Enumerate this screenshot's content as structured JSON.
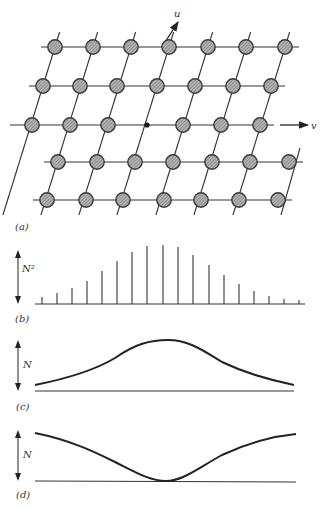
{
  "figure": {
    "panels": [
      {
        "id": "a",
        "label": "(a)",
        "description": "Oblique 2D lattice of hatched atoms with u and v axes; origin marked by a small black dot"
      },
      {
        "id": "b",
        "label": "(b)",
        "axis_label": "N²",
        "description": "Discrete stick spectrum, intensity N² vs position"
      },
      {
        "id": "c",
        "label": "(c)",
        "axis_label": "N",
        "description": "Smooth peaked envelope"
      },
      {
        "id": "d",
        "label": "(d)",
        "axis_label": "N",
        "description": "Smooth inverted (dip) envelope touching baseline at center"
      }
    ],
    "axes": {
      "u_label": "u",
      "v_label": "v"
    },
    "lattice": {
      "rows": [
        {
          "y": 47,
          "x": [
            55,
            93,
            131,
            169,
            208,
            246,
            285
          ]
        },
        {
          "y": 86,
          "x": [
            43,
            80,
            117,
            157,
            195,
            233,
            271
          ]
        },
        {
          "y": 125,
          "x": [
            32,
            70,
            108,
            183,
            221,
            260
          ]
        },
        {
          "y": 162,
          "x": [
            58,
            97,
            135,
            173,
            212,
            250,
            289
          ]
        },
        {
          "y": 200,
          "x": [
            47,
            86,
            123,
            164,
            201,
            239,
            278
          ]
        }
      ],
      "origin": {
        "x": 147,
        "y": 125
      },
      "colors": {
        "line": "#333333",
        "atom_fill": "#9a9a9a",
        "atom_stroke": "#3a3a3a",
        "origin": "#111111"
      }
    },
    "spectrum_b": {
      "baseline_y": 304,
      "x_start": 35,
      "x_end": 305,
      "sticks": [
        {
          "x": 42,
          "h": 7
        },
        {
          "x": 57,
          "h": 11
        },
        {
          "x": 72,
          "h": 16
        },
        {
          "x": 87,
          "h": 23
        },
        {
          "x": 102,
          "h": 33
        },
        {
          "x": 117,
          "h": 43
        },
        {
          "x": 132,
          "h": 52
        },
        {
          "x": 147,
          "h": 58
        },
        {
          "x": 163,
          "h": 59
        },
        {
          "x": 178,
          "h": 57
        },
        {
          "x": 193,
          "h": 49
        },
        {
          "x": 209,
          "h": 39
        },
        {
          "x": 224,
          "h": 29
        },
        {
          "x": 239,
          "h": 20
        },
        {
          "x": 254,
          "h": 13
        },
        {
          "x": 269,
          "h": 8
        },
        {
          "x": 284,
          "h": 5
        },
        {
          "x": 299,
          "h": 4
        }
      ]
    }
  }
}
